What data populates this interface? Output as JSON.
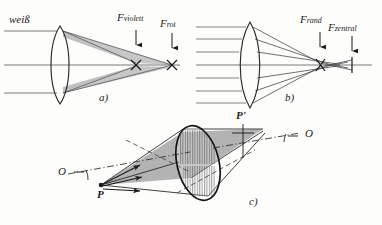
{
  "figure": {
    "background_color": "#fdfdfc",
    "ink_color": "#1a1a1a",
    "shade_color": "#9a9a9a"
  },
  "panel_a": {
    "caption": "a)",
    "incoming_label": "weiß",
    "focus_violet": {
      "symbol": "F",
      "subscript": "violett"
    },
    "focus_red": {
      "symbol": "F",
      "subscript": "rot"
    },
    "ray_count": 3,
    "description": "chromatic aberration"
  },
  "panel_b": {
    "caption": "b)",
    "focus_margin": {
      "symbol": "F",
      "subscript": "rand"
    },
    "focus_central": {
      "symbol": "F",
      "subscript": "zentral"
    },
    "ray_count": 7,
    "description": "spherical aberration"
  },
  "panel_c": {
    "caption": "c)",
    "object_point": "P",
    "image_point": "P'",
    "axis_label_left": "O",
    "axis_label_right": "O",
    "description": "oblique pencil through lens aperture"
  }
}
